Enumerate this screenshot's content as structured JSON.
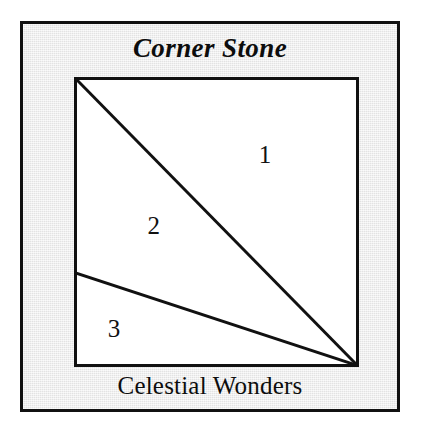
{
  "figure": {
    "title": "Corner Stone",
    "caption": "Celestial Wonders",
    "square": {
      "fill_color": "#ffffff",
      "stroke_color": "#111111"
    },
    "frame": {
      "background_color": "#ececec",
      "border_color": "#111111",
      "page_color": "#ffffff"
    },
    "regions": [
      {
        "label": "1",
        "x_pct": 67.0,
        "y_pct": 26.5
      },
      {
        "label": "2",
        "x_pct": 28.0,
        "y_pct": 51.0
      },
      {
        "label": "3",
        "x_pct": 14.0,
        "y_pct": 86.5
      }
    ],
    "lines": [
      {
        "name": "main-diagonal",
        "from": "top-left-corner",
        "to": "bottom-right-corner"
      },
      {
        "name": "lower-diagonal",
        "from": "left-edge-point",
        "to": "bottom-right-corner"
      }
    ]
  }
}
